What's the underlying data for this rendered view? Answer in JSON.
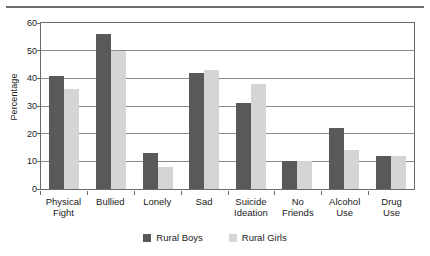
{
  "chart_data": {
    "type": "bar",
    "title": "",
    "xlabel": "",
    "ylabel": "Percentage",
    "ylim": [
      0,
      60
    ],
    "yticks": [
      0,
      10,
      20,
      30,
      40,
      50,
      60
    ],
    "grid": true,
    "legend_position": "bottom",
    "categories": [
      "Physical Fight",
      "Bullied",
      "Lonely",
      "Sad",
      "Suicide Ideation",
      "No Friends",
      "Alcohol Use",
      "Drug Use"
    ],
    "category_lines": [
      [
        "Physical",
        "Fight"
      ],
      [
        "Bullied",
        ""
      ],
      [
        "Lonely",
        ""
      ],
      [
        "Sad",
        ""
      ],
      [
        "Suicide",
        "Ideation"
      ],
      [
        "No",
        "Friends"
      ],
      [
        "Alcohol",
        "Use"
      ],
      [
        "Drug",
        "Use"
      ]
    ],
    "series": [
      {
        "name": "Rural Boys",
        "color": "#58595b",
        "values": [
          41,
          56,
          13,
          42,
          31,
          10,
          22,
          12
        ]
      },
      {
        "name": "Rural Girls",
        "color": "#d5d5d5",
        "values": [
          36,
          50,
          8,
          43,
          38,
          10,
          14,
          12
        ]
      }
    ]
  },
  "legend": {
    "items": [
      {
        "label": "Rural Boys",
        "swatch": "boys"
      },
      {
        "label": "Rural Girls",
        "swatch": "girls"
      }
    ]
  }
}
